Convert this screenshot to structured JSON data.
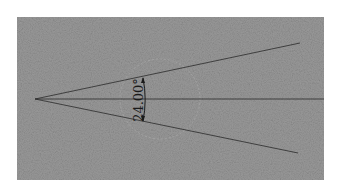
{
  "diagram": {
    "type": "angle-dimension",
    "angle_label": "24.00°",
    "angle_value_deg": 24.0,
    "colors": {
      "background": "#8a8a8a",
      "line": "#2a2a2a",
      "text": "#1a1a1a",
      "page": "#ffffff"
    }
  }
}
